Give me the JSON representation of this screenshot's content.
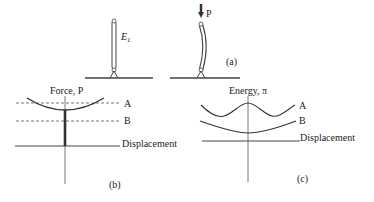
{
  "figure": {
    "panel_a": {
      "caption": "(a)",
      "column_label": "E",
      "column_label_subscript": "1",
      "load_label": "P"
    },
    "panel_b": {
      "caption": "(b)",
      "y_axis_label": "Force, P",
      "x_axis_label": "Displacement",
      "line_a_label": "A",
      "line_b_label": "B"
    },
    "panel_c": {
      "caption": "(c)",
      "y_axis_label": "Energy, π",
      "x_axis_label": "Displacement",
      "curve_a_label": "A",
      "curve_b_label": "B"
    },
    "colors": {
      "ink": "#333333",
      "dash": "#555555"
    }
  }
}
